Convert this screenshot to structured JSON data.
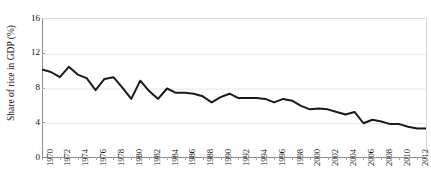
{
  "chart_data": {
    "type": "line",
    "title": "",
    "xlabel": "",
    "ylabel": "Share of rice in GDP (%)",
    "ylim": [
      0,
      16
    ],
    "yticks": [
      0,
      4,
      8,
      12,
      16
    ],
    "ytick_labels": [
      "0",
      "4",
      "8",
      "12",
      "16"
    ],
    "xlim": [
      1970,
      2013
    ],
    "xticks": [
      1970,
      1972,
      1974,
      1976,
      1978,
      1980,
      1982,
      1984,
      1986,
      1988,
      1990,
      1992,
      1994,
      1996,
      1998,
      2000,
      2002,
      2004,
      2006,
      2008,
      2010,
      2012
    ],
    "xtick_labels": [
      "1970",
      "1972",
      "1974",
      "1976",
      "1978",
      "1980",
      "1982",
      "1984",
      "1986",
      "1988",
      "1990",
      "1992",
      "1994",
      "1996",
      "1998",
      "2000",
      "2002",
      "2004",
      "2006",
      "2008",
      "2010",
      "2012"
    ],
    "xtick_rotation": -90,
    "grid": "horizontal",
    "legend": "none",
    "line_color": "#1a1a1a",
    "line_width": 2.0,
    "grid_color": "#e6e6e6",
    "axis_color": "#8c8c8c",
    "background": "#ffffff",
    "x": [
      1970,
      1971,
      1972,
      1973,
      1974,
      1975,
      1976,
      1977,
      1978,
      1979,
      1980,
      1981,
      1982,
      1983,
      1984,
      1985,
      1986,
      1987,
      1988,
      1989,
      1990,
      1991,
      1992,
      1993,
      1994,
      1995,
      1996,
      1997,
      1998,
      1999,
      2000,
      2001,
      2002,
      2003,
      2004,
      2005,
      2006,
      2007,
      2008,
      2009,
      2010,
      2011,
      2012,
      2013
    ],
    "values": [
      10.2,
      9.9,
      9.3,
      10.5,
      9.6,
      9.2,
      7.8,
      9.1,
      9.3,
      8.1,
      6.8,
      8.9,
      7.7,
      6.8,
      8.0,
      7.5,
      7.5,
      7.4,
      7.1,
      6.4,
      7.0,
      7.4,
      6.9,
      6.9,
      6.9,
      6.8,
      6.4,
      6.8,
      6.6,
      6.0,
      5.6,
      5.7,
      5.6,
      5.3,
      5.0,
      5.3,
      4.0,
      4.4,
      4.2,
      3.9,
      3.9,
      3.6,
      3.4,
      3.4
    ],
    "series_name": "Share of rice in GDP"
  }
}
